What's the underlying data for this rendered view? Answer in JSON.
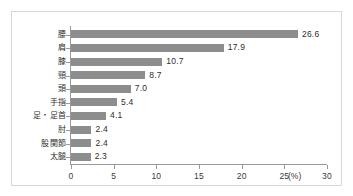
{
  "chart_data": {
    "type": "bar",
    "orientation": "horizontal",
    "title": "",
    "xlabel": "(%)",
    "ylabel": "",
    "xlim": [
      0,
      30
    ],
    "xticks": [
      0,
      5,
      10,
      15,
      20,
      25,
      30
    ],
    "xtick_labels": [
      "0",
      "5",
      "10",
      "15",
      "20",
      "25",
      "30"
    ],
    "unit_label": "(%)",
    "grid": false,
    "legend": false,
    "categories": [
      "腰",
      "肩",
      "膝",
      "頸",
      "頭",
      "手指",
      "足・足首",
      "肘",
      "股関節",
      "太腿"
    ],
    "values": [
      26.6,
      17.9,
      10.7,
      8.7,
      7.0,
      5.4,
      4.1,
      2.4,
      2.4,
      2.3
    ],
    "value_labels": [
      "26.6",
      "17.9",
      "10.7",
      "8.7",
      "7.0",
      "5.4",
      "4.1",
      "2.4",
      "2.4",
      "2.3"
    ],
    "bar_color": "#8d8d8d",
    "axis_color": "#9a9a9a",
    "text_color": "#2e2e2e",
    "frame_color": "#d7d7d7",
    "background_color": "#ffffff"
  }
}
